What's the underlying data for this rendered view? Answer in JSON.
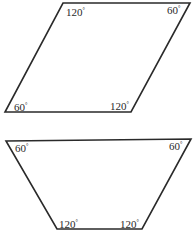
{
  "figures": [
    {
      "name": "parallelogram",
      "vertices": [
        [
          63,
          3
        ],
        [
          190,
          3
        ],
        [
          131,
          112
        ],
        [
          5,
          112
        ]
      ],
      "angles": [
        {
          "corner": "top-left",
          "value": "120",
          "unit": "°",
          "x": 66,
          "y": 16
        },
        {
          "corner": "top-right",
          "value": "60",
          "unit": "°",
          "x": 167,
          "y": 14
        },
        {
          "corner": "bottom-left",
          "value": "60",
          "unit": "°",
          "x": 14,
          "y": 111
        },
        {
          "corner": "bottom-right",
          "value": "120",
          "unit": "°",
          "x": 110,
          "y": 110
        }
      ]
    },
    {
      "name": "trapezoid",
      "vertices": [
        [
          6,
          141
        ],
        [
          191,
          139
        ],
        [
          142,
          229
        ],
        [
          57,
          229
        ]
      ],
      "angles": [
        {
          "corner": "top-left",
          "value": "60",
          "unit": "°",
          "x": 15,
          "y": 152
        },
        {
          "corner": "top-right",
          "value": "60",
          "unit": "°",
          "x": 169,
          "y": 150
        },
        {
          "corner": "bottom-left",
          "value": "120",
          "unit": "°",
          "x": 59,
          "y": 228
        },
        {
          "corner": "bottom-right",
          "value": "120",
          "unit": "°",
          "x": 120,
          "y": 228
        }
      ]
    }
  ],
  "stroke_color": "#2a2a2a"
}
